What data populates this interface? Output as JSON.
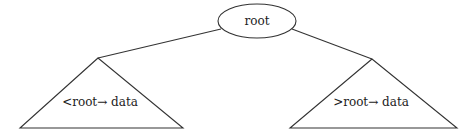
{
  "diagram": {
    "type": "binary-search-tree-schematic",
    "root": {
      "label": "root"
    },
    "left_subtree": {
      "label": "<root→ data"
    },
    "right_subtree": {
      "label": ">root→ data"
    },
    "colors": {
      "stroke": "#333333",
      "text": "#222222",
      "background": "#ffffff"
    }
  }
}
